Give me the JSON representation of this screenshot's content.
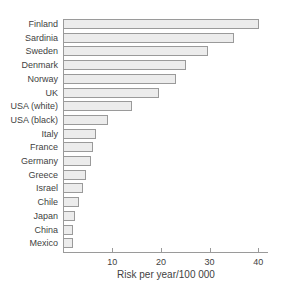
{
  "chart_data": {
    "type": "bar",
    "orientation": "horizontal",
    "categories": [
      "Finland",
      "Sardinia",
      "Sweden",
      "Denmark",
      "Norway",
      "UK",
      "USA (white)",
      "USA (black)",
      "Italy",
      "France",
      "Germany",
      "Greece",
      "Israel",
      "Chile",
      "Japan",
      "China",
      "Mexico"
    ],
    "values": [
      40,
      35,
      29.5,
      25,
      23,
      19.5,
      14,
      9,
      6.5,
      6,
      5.5,
      4.5,
      4,
      3,
      2.3,
      1.8,
      1.8
    ],
    "xlabel": "Risk per year/100 000",
    "xtick_labels": [
      "10",
      "20",
      "30",
      "40"
    ],
    "xtick_values": [
      10,
      20,
      30,
      40
    ],
    "xlim": [
      0,
      42
    ],
    "grid": "off",
    "legend": "none",
    "colors": {
      "bar_fill": "#ececec",
      "bar_border": "#9a9a9a",
      "axis": "#9a9a9a",
      "text": "#3f3f3f"
    }
  }
}
